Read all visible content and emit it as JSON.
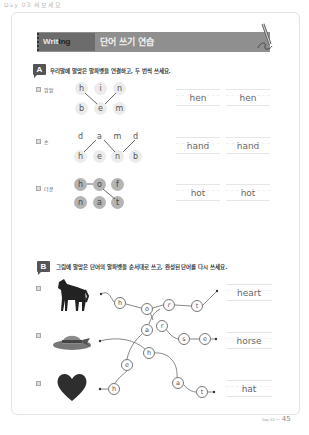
{
  "page": {
    "top_label": "Day 03 써보세요",
    "page_number": "45",
    "page_footer_small": "Day 03 ──"
  },
  "banner": {
    "tag_light": "Writ",
    "tag_dark": "ing",
    "title": "단어 쓰기 연습"
  },
  "section_a": {
    "badge": "A",
    "instruction": "우리말에 알맞은 알파벳을 연결하고, 두 번씩 쓰세요.",
    "rows": [
      {
        "num": "1",
        "label": "암탉",
        "top_letters": [
          "h",
          "i",
          "n"
        ],
        "bottom_letters": [
          "b",
          "e",
          "m"
        ],
        "answer": "hen",
        "writes": [
          "hen",
          "hen"
        ]
      },
      {
        "num": "2",
        "label": "손",
        "top_letters": [
          "d",
          "a",
          "m",
          "d"
        ],
        "bottom_letters": [
          "h",
          "e",
          "n",
          "b"
        ],
        "answer": "hand",
        "writes": [
          "hand",
          "hand"
        ]
      },
      {
        "num": "3",
        "label": "더운",
        "top_letters": [
          "h",
          "o",
          "f"
        ],
        "bottom_letters": [
          "n",
          "a",
          "t"
        ],
        "answer": "hot",
        "writes": [
          "hot",
          "hot"
        ]
      }
    ]
  },
  "section_b": {
    "badge": "B",
    "instruction": "그림에 알맞은 단어의 알파벳을 순서대로 쓰고, 완성된 단어를 다시 쓰세요.",
    "rows": [
      {
        "num": "1",
        "picture": "horse-image",
        "answer": "heart"
      },
      {
        "num": "2",
        "picture": "hat-image",
        "answer": "horse"
      },
      {
        "num": "3",
        "picture": "heart-image",
        "answer": "hat"
      }
    ],
    "circles": [
      {
        "letter": "h",
        "x": 114,
        "y": 297
      },
      {
        "letter": "o",
        "x": 141,
        "y": 303
      },
      {
        "letter": "r",
        "x": 163,
        "y": 299
      },
      {
        "letter": "t",
        "x": 191,
        "y": 300
      },
      {
        "letter": "a",
        "x": 141,
        "y": 324
      },
      {
        "letter": "r",
        "x": 156,
        "y": 320
      },
      {
        "letter": "s",
        "x": 178,
        "y": 333
      },
      {
        "letter": "e",
        "x": 199,
        "y": 333
      },
      {
        "letter": "h",
        "x": 143,
        "y": 347
      },
      {
        "letter": "e",
        "x": 121,
        "y": 359
      },
      {
        "letter": "h",
        "x": 108,
        "y": 383
      },
      {
        "letter": "a",
        "x": 172,
        "y": 377
      },
      {
        "letter": "t",
        "x": 196,
        "y": 386
      }
    ]
  },
  "colors": {
    "banner_bg": "#8f8f8f",
    "banner_tag_bg": "#6c6c6c",
    "letter_bg": "#ececec",
    "letter_filled_bg": "#b4b4b4"
  }
}
